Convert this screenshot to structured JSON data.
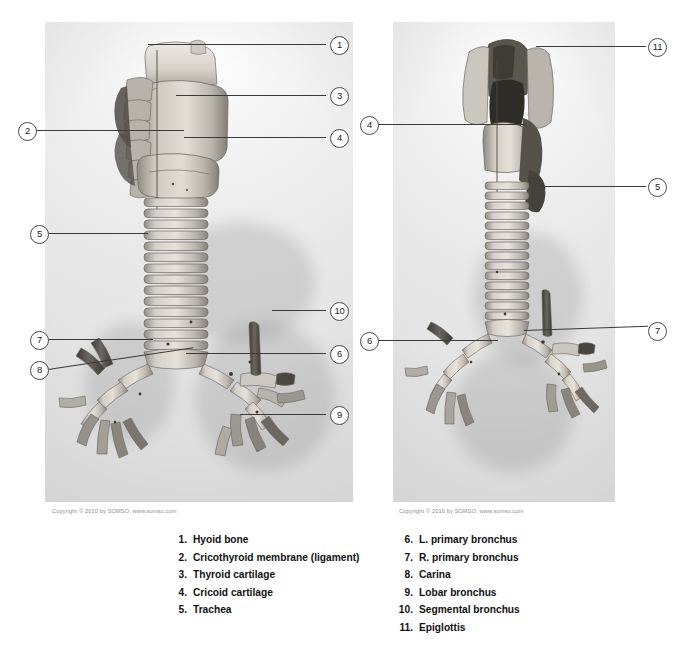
{
  "figure": {
    "copyright_left": "Copyright © 2010 by SOMSO, www.somso.com",
    "copyright_right": "Copyright © 2010 by SOMSO, www.somso.com"
  },
  "colors": {
    "background": "#ffffff",
    "photo_light": "#f2f2f2",
    "photo_mid": "#e8e8e8",
    "specimen_light": "#d9d6cf",
    "specimen_mid": "#b3afa6",
    "specimen_dark": "#6f6b63",
    "callout_line": "#3a3a3a",
    "callout_ring": "#4a4a4a",
    "legend_text": "#111111",
    "copyright_text": "#8d8d8d"
  },
  "panels": [
    {
      "name": "anterior-view",
      "view": "anterior",
      "callouts": [
        {
          "n": "1",
          "side": "right"
        },
        {
          "n": "3",
          "side": "right"
        },
        {
          "n": "4",
          "side": "right"
        },
        {
          "n": "2",
          "side": "left"
        },
        {
          "n": "5",
          "side": "left"
        },
        {
          "n": "7",
          "side": "left"
        },
        {
          "n": "8",
          "side": "left"
        },
        {
          "n": "10",
          "side": "right"
        },
        {
          "n": "6",
          "side": "right"
        },
        {
          "n": "9",
          "side": "right"
        }
      ]
    },
    {
      "name": "posterior-view",
      "view": "posterior",
      "callouts": [
        {
          "n": "11",
          "side": "right"
        },
        {
          "n": "5",
          "side": "right"
        },
        {
          "n": "7",
          "side": "right"
        },
        {
          "n": "4",
          "side": "left"
        },
        {
          "n": "6",
          "side": "left"
        }
      ]
    }
  ],
  "legend": {
    "left_column": [
      {
        "num": "1.",
        "label": "Hyoid bone"
      },
      {
        "num": "2.",
        "label": "Cricothyroid membrane (ligament)"
      },
      {
        "num": "3.",
        "label": "Thyroid cartilage"
      },
      {
        "num": "4.",
        "label": "Cricoid cartilage"
      },
      {
        "num": "5.",
        "label": "Trachea"
      }
    ],
    "right_column": [
      {
        "num": "6.",
        "label": "L. primary bronchus"
      },
      {
        "num": "7.",
        "label": "R. primary bronchus"
      },
      {
        "num": "8.",
        "label": "Carina"
      },
      {
        "num": "9.",
        "label": "Lobar bronchus"
      },
      {
        "num": "10.",
        "label": "Segmental bronchus"
      },
      {
        "num": "11.",
        "label": "Epiglottis"
      }
    ]
  }
}
